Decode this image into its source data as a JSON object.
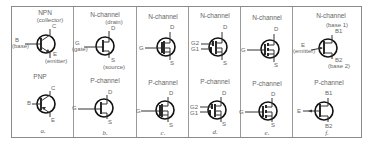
{
  "diagram": {
    "columns": [
      {
        "caption": "a.",
        "top": {
          "label": "NPN",
          "terminals": {
            "collector": "C",
            "collector_note": "(collector)",
            "base": "B",
            "base_note": "(base)",
            "emitter": "E",
            "emitter_note": "(emitter)"
          }
        },
        "bottom": {
          "label": "PNP",
          "terminals": {
            "collector": "C",
            "base": "B",
            "emitter": "E"
          }
        }
      },
      {
        "caption": "b.",
        "top": {
          "label": "N-channel",
          "terminals": {
            "drain": "D",
            "drain_note": "(drain)",
            "gate": "G",
            "gate_note": "(gate)",
            "source": "S",
            "source_note": "(source)"
          }
        },
        "bottom": {
          "label": "P-channel",
          "terminals": {
            "drain": "D",
            "gate": "G",
            "source": "S"
          }
        }
      },
      {
        "caption": "c.",
        "top": {
          "label": "N-channel",
          "terminals": {
            "drain": "D",
            "gate": "G",
            "source": "S"
          }
        },
        "bottom": {
          "label": "P-channel",
          "terminals": {
            "drain": "D",
            "gate": "G",
            "source": "S"
          }
        }
      },
      {
        "caption": "d.",
        "top": {
          "label": "N-channel",
          "terminals": {
            "drain": "D",
            "gate2": "G2",
            "gate1": "G1",
            "source": "S"
          }
        },
        "bottom": {
          "label": "P-channel",
          "terminals": {
            "drain": "D",
            "gate2": "G2",
            "gate1": "G1",
            "source": "S"
          }
        }
      },
      {
        "caption": "e.",
        "top": {
          "label": "N-channel",
          "terminals": {
            "drain": "D",
            "gate": "G",
            "source": "S"
          }
        },
        "bottom": {
          "label": "P-channel",
          "terminals": {
            "drain": "D",
            "gate": "G",
            "source": "S"
          }
        }
      },
      {
        "caption": "f.",
        "top": {
          "label": "N-channel",
          "terminals": {
            "base1": "B1",
            "base1_note": "(base 1)",
            "emitter": "E",
            "emitter_note": "(emitter)",
            "base2": "B2",
            "base2_note": "(base 2)"
          }
        },
        "bottom": {
          "label": "P-channel",
          "terminals": {
            "base1": "B1",
            "emitter": "E",
            "base2": "B2"
          }
        }
      }
    ]
  }
}
